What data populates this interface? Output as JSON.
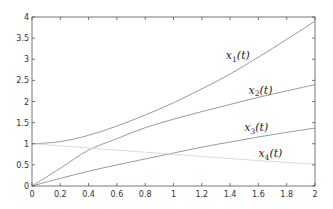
{
  "chart_data": {
    "type": "line",
    "title": "",
    "xlabel": "",
    "ylabel": "",
    "xlim": [
      0,
      2
    ],
    "ylim": [
      0,
      4
    ],
    "grid": false,
    "legend": "inline labels",
    "x_ticks": [
      "0",
      "0.2",
      "0.4",
      "0.6",
      "0.8",
      "1",
      "1.2",
      "1.4",
      "1.6",
      "1.8",
      "2"
    ],
    "y_ticks": [
      "0",
      "0.5",
      "1",
      "1.5",
      "2",
      "2.5",
      "3",
      "3.5",
      "4"
    ],
    "x": [
      0,
      0.2,
      0.4,
      0.6,
      0.8,
      1.0,
      1.2,
      1.4,
      1.6,
      1.8,
      2.0
    ],
    "series": [
      {
        "name": "x1(t)",
        "label_main": "x",
        "label_sub": "1",
        "label_arg": "(t)",
        "color": "#9a9a9a",
        "values": [
          1.0,
          1.05,
          1.2,
          1.42,
          1.68,
          1.97,
          2.3,
          2.65,
          3.05,
          3.47,
          3.9
        ]
      },
      {
        "name": "x2(t)",
        "label_main": "x",
        "label_sub": "2",
        "label_arg": "(t)",
        "color": "#9a9a9a",
        "values": [
          0.0,
          0.42,
          0.85,
          1.12,
          1.38,
          1.58,
          1.76,
          1.93,
          2.1,
          2.25,
          2.4
        ]
      },
      {
        "name": "x3(t)",
        "label_main": "x",
        "label_sub": "3",
        "label_arg": "(t)",
        "color": "#9a9a9a",
        "values": [
          0.0,
          0.18,
          0.35,
          0.5,
          0.64,
          0.78,
          0.92,
          1.04,
          1.16,
          1.27,
          1.37
        ]
      },
      {
        "name": "x4(t)",
        "label_main": "x",
        "label_sub": "4",
        "label_arg": "(t)",
        "color": "#dcdcdc",
        "values": [
          1.0,
          0.95,
          0.9,
          0.85,
          0.8,
          0.75,
          0.7,
          0.65,
          0.6,
          0.56,
          0.52
        ]
      }
    ],
    "annotations": [
      {
        "text": "x1(t)",
        "x": 1.37,
        "y": 3.0
      },
      {
        "text": "x2(t)",
        "x": 1.53,
        "y": 2.18
      },
      {
        "text": "x3(t)",
        "x": 1.5,
        "y": 1.3
      },
      {
        "text": "x4(t)",
        "x": 1.6,
        "y": 0.68
      }
    ]
  }
}
